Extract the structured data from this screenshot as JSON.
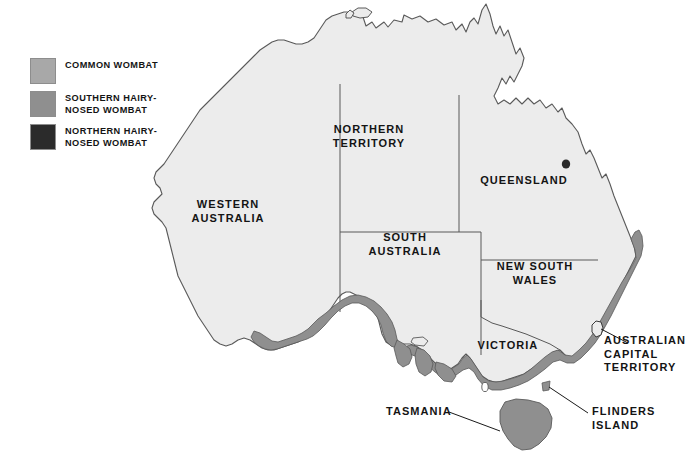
{
  "figure": {
    "background": "#ffffff"
  },
  "colors": {
    "land_fill": "#ececec",
    "land_stroke": "#595959",
    "border_stroke": "#595959",
    "common_wombat": "#a8a8a8",
    "southern_hairy_nosed_wombat": "#8f8f8f",
    "northern_hairy_nosed_wombat": "#2b2b2b",
    "text": "#141414",
    "leader_line": "#1a1a1a"
  },
  "legend": {
    "items": [
      {
        "label": "COMMON WOMBAT",
        "color": "#a8a8a8",
        "swatch_name": "legend-swatch-common-wombat"
      },
      {
        "label": "SOUTHERN HAIRY-\nNOSED WOMBAT",
        "color": "#8f8f8f",
        "swatch_name": "legend-swatch-southern-hairy-nosed-wombat"
      },
      {
        "label": "NORTHERN HAIRY-\nNOSED WOMBAT",
        "color": "#2b2b2b",
        "swatch_name": "legend-swatch-northern-hairy-nosed-wombat"
      }
    ]
  },
  "map": {
    "state_labels": [
      {
        "id": "western-australia",
        "text": "WESTERN\nAUSTRALIA"
      },
      {
        "id": "northern-territory",
        "text": "NORTHERN\nTERRITORY"
      },
      {
        "id": "queensland",
        "text": "QUEENSLAND"
      },
      {
        "id": "south-australia",
        "text": "SOUTH\nAUSTRALIA"
      },
      {
        "id": "new-south-wales",
        "text": "NEW SOUTH\nWALES"
      },
      {
        "id": "victoria",
        "text": "VICTORIA"
      },
      {
        "id": "act",
        "text": "AUSTRALIAN\nCAPITAL\nTERRITORY"
      },
      {
        "id": "tasmania",
        "text": "TASMANIA"
      },
      {
        "id": "flinders-island",
        "text": "FLINDERS\nISLAND"
      }
    ],
    "annotations": {
      "northern_hairy_nosed_locality": "Epping Forest (Queensland) dot marker"
    }
  }
}
